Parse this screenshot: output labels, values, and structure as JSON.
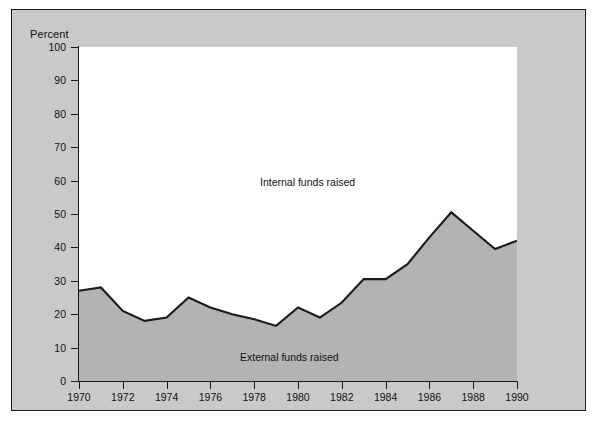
{
  "figure": {
    "background_color": "#c9c9c9",
    "plot_background_color": "#ffffff",
    "border_color": "#1a1a1a",
    "area_fill_color": "#b3b3b3",
    "line_color": "#1a1a1a"
  },
  "axis": {
    "y_title": "Percent",
    "y_ticks": [
      "100",
      "90",
      "80",
      "70",
      "60",
      "50",
      "40",
      "30",
      "20",
      "10",
      "0"
    ],
    "x_ticks": [
      "1970",
      "1972",
      "1974",
      "1976",
      "1978",
      "1980",
      "1982",
      "1984",
      "1986",
      "1988",
      "1990"
    ]
  },
  "annotations": {
    "internal": "Internal funds raised",
    "external": "External funds raised"
  },
  "chart_data": {
    "type": "area",
    "title": "",
    "subtitle": "",
    "xlabel": "",
    "ylabel": "Percent",
    "xlim": [
      1970,
      1990
    ],
    "ylim": [
      0,
      100
    ],
    "ytick_interval": 10,
    "xtick_interval": 2,
    "grid": false,
    "legend": "inline-annotations",
    "stacked": true,
    "x": [
      1970,
      1971,
      1972,
      1973,
      1974,
      1975,
      1976,
      1977,
      1978,
      1979,
      1980,
      1981,
      1982,
      1983,
      1984,
      1985,
      1986,
      1987,
      1988,
      1989,
      1990
    ],
    "series": [
      {
        "name": "External funds raised",
        "region": "below-line",
        "fill": "#b3b3b3",
        "values": [
          27,
          28,
          21,
          18,
          19,
          25,
          22,
          20,
          18.5,
          16.5,
          22,
          19,
          23.5,
          30.5,
          30.5,
          35,
          43,
          50.5,
          45,
          39.5,
          42
        ]
      },
      {
        "name": "Internal funds raised",
        "region": "above-line",
        "fill": "#ffffff",
        "values": [
          73,
          72,
          79,
          82,
          81,
          75,
          78,
          80,
          81.5,
          83.5,
          78,
          81,
          76.5,
          69.5,
          69.5,
          65,
          57,
          49.5,
          55,
          60.5,
          58
        ]
      }
    ]
  }
}
